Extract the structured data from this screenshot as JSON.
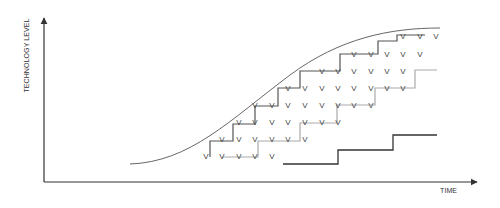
{
  "diagram": {
    "y_axis_label": "TECHNOLOGY LEVEL",
    "x_axis_label": "TIME",
    "marker_glyph": "V",
    "colors": {
      "axis": "#333333",
      "s_curve": "#666666",
      "upper_staircase": "#555555",
      "lower_staircase": "#aaaaaa",
      "bottom_staircase": "#333333",
      "marker": "#444444"
    },
    "grid": {
      "columns_x": [
        206,
        222,
        239,
        255,
        272,
        288,
        305,
        322,
        338,
        354,
        371,
        387,
        403,
        420,
        436
      ],
      "rows": [
        {
          "y": 157,
          "cols": [
            0,
            1,
            2,
            3,
            4
          ]
        },
        {
          "y": 140,
          "cols": [
            1,
            2,
            3,
            4,
            5,
            6
          ]
        },
        {
          "y": 123,
          "cols": [
            2,
            3,
            4,
            5,
            6,
            7,
            8
          ]
        },
        {
          "y": 106,
          "cols": [
            3,
            4,
            5,
            6,
            7,
            8,
            9,
            10
          ]
        },
        {
          "y": 89,
          "cols": [
            5,
            6,
            7,
            8,
            9,
            10,
            11,
            12
          ]
        },
        {
          "y": 72,
          "cols": [
            7,
            8,
            9,
            10,
            11,
            12
          ]
        },
        {
          "y": 55,
          "cols": [
            9,
            10,
            11,
            12,
            13
          ]
        },
        {
          "y": 37,
          "cols": [
            12,
            13,
            14
          ]
        }
      ]
    },
    "curves": {
      "s_curve": "M130,164 C190,162 230,120 290,75 C340,38 390,28 440,28",
      "upper_staircase": "210,157 210,141 233,141 233,124 255,124 255,106 278,106 278,88 300,88 300,71 340,71 340,54 378,54 378,41 397,41 397,35 425,35",
      "lower_staircase": "222,157 258,157 258,141 300,141 300,123 337,123 337,105 375,105 375,88 415,88 415,70 437,70",
      "bottom_staircase": "283,164 338,164 338,150 393,150 393,135 437,135"
    }
  }
}
